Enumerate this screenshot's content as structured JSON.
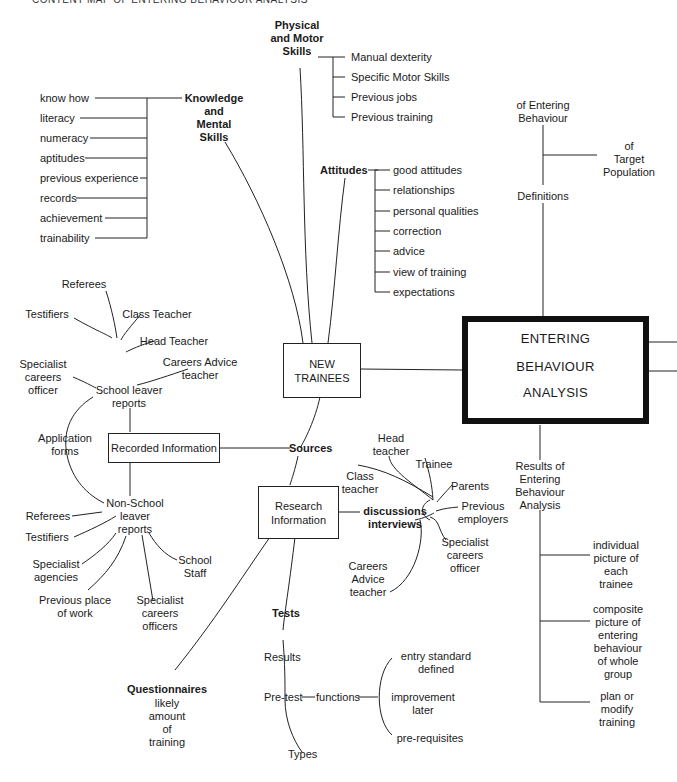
{
  "title": "CONTENT MAP OF ENTERING BEHAVIOUR ANALYSIS",
  "central": {
    "lines": [
      "ENTERING",
      "BEHAVIOUR",
      "ANALYSIS"
    ]
  },
  "new_trainees": {
    "label": "NEW\nTRAINEES"
  },
  "physical_motor": {
    "label": "Physical\nand Motor\nSkills",
    "items": [
      "Manual dexterity",
      "Specific Motor Skills",
      "Previous jobs",
      "Previous training"
    ]
  },
  "knowledge": {
    "label": "Knowledge\nand\nMental\nSkills",
    "items": [
      "know how",
      "literacy",
      "numeracy",
      "aptitudes",
      "previous experience",
      "records",
      "achievement",
      "trainability"
    ]
  },
  "attitudes": {
    "label": "Attitudes",
    "items": [
      "good attitudes",
      "relationships",
      "personal qualities",
      "correction",
      "advice",
      "view of training",
      "expectations"
    ]
  },
  "definitions": {
    "label": "Definitions",
    "of_entering": "of Entering\nBehaviour",
    "of_target": "of\nTarget\nPopulation"
  },
  "sources": {
    "label": "Sources",
    "recorded": "Recorded Information",
    "research": "Research\nInformation"
  },
  "school_leaver": {
    "label": "School leaver\nreports",
    "items": [
      "Referees",
      "Testifiers",
      "Class Teacher",
      "Head Teacher",
      "Careers Advice\nteacher",
      "Specialist\ncareers\nofficer"
    ]
  },
  "application_forms": "Application\nforms",
  "non_school": {
    "label": "Non-School\nleaver\nreports",
    "items": [
      "Referees",
      "Testifiers",
      "Specialist\nagencies",
      "Previous place\nof work",
      "Specialist\ncareers\nofficers",
      "School\nStaff"
    ]
  },
  "discussions": {
    "label": "discussions\ninterviews",
    "items": [
      "Head\nteacher",
      "Trainee",
      "Class\nteacher",
      "Parents",
      "Previous\nemployers",
      "Specialist\ncareers\nofficer",
      "Careers\nAdvice\nteacher"
    ]
  },
  "questionnaires": {
    "label": "Questionnaires",
    "sub": "likely\namount\nof\ntraining"
  },
  "tests": {
    "label": "Tests",
    "results": "Results",
    "pretest": "Pre-test",
    "functions": "functions",
    "types": "Types",
    "function_items": [
      "entry standard\ndefined",
      "improvement\nlater",
      "pre-requisites"
    ]
  },
  "results_eba": {
    "label": "Results of\nEntering\nBehaviour\nAnalysis",
    "items": [
      "individual\npicture of\neach\ntrainee",
      "composite\npicture of\nentering\nbehaviour\nof whole\ngroup",
      "plan or\nmodify\ntraining"
    ]
  }
}
